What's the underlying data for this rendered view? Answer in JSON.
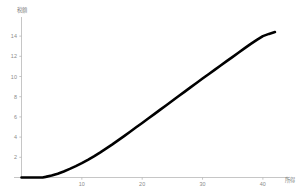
{
  "chart_data": {
    "type": "line",
    "title": "",
    "xlabel": "所得",
    "ylabel": "税額",
    "xlim": [
      0,
      43.5
    ],
    "ylim": [
      0,
      15.2
    ],
    "xticks": [
      10,
      20,
      30,
      40
    ],
    "yticks": [
      2,
      4,
      6,
      8,
      10,
      12,
      14
    ],
    "xtick_labels": [
      "10",
      "20",
      "30",
      "40"
    ],
    "ytick_labels": [
      "2",
      "4",
      "6",
      "8",
      "10",
      "12",
      "14"
    ],
    "grid": false,
    "legend": false,
    "legend_position": "none",
    "line_color": "#000000",
    "axis_color": "#b8b8b8",
    "tick_label_color": "#8a8a8a",
    "background_color": "#ffffff",
    "line_width": 2.6,
    "series": [
      {
        "name": "税額",
        "x": [
          0.0,
          1.0,
          2.0,
          3.0,
          3.5,
          4.0,
          5.0,
          6.0,
          7.0,
          8.0,
          9.0,
          10.0,
          11.0,
          12.0,
          13.0,
          14.0,
          15.0,
          16.0,
          17.0,
          18.0,
          19.0,
          20.0,
          21.0,
          22.0,
          23.0,
          24.0,
          25.0,
          26.0,
          27.0,
          28.0,
          29.0,
          30.0,
          31.0,
          32.0,
          33.0,
          34.0,
          35.0,
          36.0,
          37.0,
          38.0,
          39.0,
          40.0,
          41.0,
          42.0
        ],
        "y": [
          0.0,
          0.0,
          0.0,
          0.0,
          0.0,
          0.06,
          0.2,
          0.38,
          0.6,
          0.85,
          1.12,
          1.42,
          1.75,
          2.1,
          2.47,
          2.86,
          3.26,
          3.68,
          4.1,
          4.53,
          4.97,
          5.4,
          5.84,
          6.28,
          6.72,
          7.16,
          7.6,
          8.04,
          8.48,
          8.92,
          9.36,
          9.8,
          10.23,
          10.66,
          11.09,
          11.52,
          11.95,
          12.38,
          12.81,
          13.23,
          13.63,
          14.0,
          14.22,
          14.4
        ]
      }
    ]
  },
  "axis_titles": {
    "x": "所得",
    "y": "税額"
  }
}
